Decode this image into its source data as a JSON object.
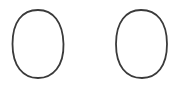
{
  "canvas": {
    "width": 194,
    "height": 88,
    "background": "#ffffff"
  },
  "shapes": [
    {
      "type": "oval",
      "cx": 38,
      "cy": 44,
      "rx": 25.5,
      "ry": 34,
      "stroke": "#3a3a3a",
      "stroke_width": 1.8,
      "fill": "none"
    },
    {
      "type": "oval",
      "cx": 141.5,
      "cy": 44,
      "rx": 25.5,
      "ry": 34,
      "stroke": "#3a3a3a",
      "stroke_width": 1.8,
      "fill": "none"
    }
  ]
}
